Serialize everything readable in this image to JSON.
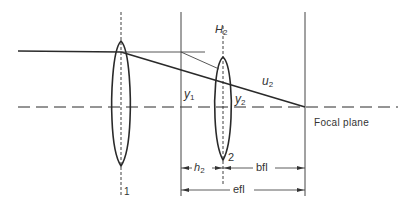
{
  "diagram": {
    "colors": {
      "line": "#2a2a2a",
      "thin_line": "#555555",
      "background": "#ffffff"
    },
    "labels": {
      "H2": {
        "main": "H",
        "sub": "2"
      },
      "u2": {
        "main": "u",
        "sub": "2"
      },
      "y1": {
        "main": "y",
        "sub": "1"
      },
      "y2": {
        "main": "y",
        "sub": "2"
      },
      "h2": {
        "main": "h",
        "sub": "2"
      },
      "lens1_number": "1",
      "lens2_number": "2",
      "focal_plane": "Focal plane",
      "bfl": "bfl",
      "efl": "efl"
    },
    "elements": {
      "lens1": {
        "cx": 121,
        "top": 41,
        "bottom": 166,
        "halfwidth": 7
      },
      "lens2": {
        "cx": 223,
        "top": 57,
        "bottom": 160,
        "halfwidth": 7
      },
      "principal_plane_x": 181,
      "focal_plane_x": 305,
      "optical_axis_y": 107,
      "incoming_ray_y": 51
    }
  }
}
